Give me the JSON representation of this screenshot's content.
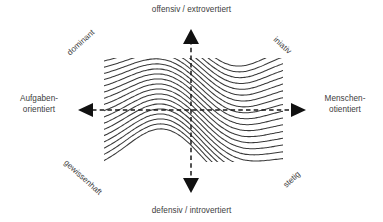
{
  "diagram": {
    "axes": {
      "top": {
        "name": "vertical-axis-top",
        "label": "offensiv / extrovertiert",
        "arrow": "arrow-up"
      },
      "bottom": {
        "name": "vertical-axis-bottom",
        "label": "defensiv / introvertiert",
        "arrow": "arrow-down"
      },
      "left": {
        "name": "horizontal-axis-left",
        "label": "Aufgaben-\norientiert",
        "arrow": "arrow-left"
      },
      "right": {
        "name": "horizontal-axis-right",
        "label": "Menschen-\notientiert",
        "arrow": "arrow-right"
      }
    },
    "quadrants": [
      {
        "key": "dominant",
        "label": "dominant",
        "position": "top-left",
        "rotation": -42
      },
      {
        "key": "iniativ",
        "label": "iniativ",
        "position": "top-right",
        "rotation": 42
      },
      {
        "key": "gewissenhaft",
        "label": "gewissenhaft",
        "position": "bottom-left",
        "rotation": 42
      },
      {
        "key": "stetig",
        "label": "stetig",
        "position": "bottom-right",
        "rotation": -42
      }
    ],
    "colors": {
      "background": "#ffffff",
      "text": "#3d3d3d",
      "curve": "#3a3a3a",
      "axis": "#1a1a1a"
    }
  },
  "chart_data": {
    "type": "line",
    "xlabel": "Aufgabenorientiert ↔ Menschenorientiert",
    "ylabel": "defensiv / introvertiert ↔ offensiv / extrovertiert",
    "grid": false,
    "legend_position": "none",
    "xlim": [
      0,
      100
    ],
    "ylim": [
      0,
      100
    ],
    "annotations": [
      "offensiv / extrovertiert",
      "defensiv / introvertiert",
      "Aufgaben-orientiert",
      "Menschen-otientiert",
      "dominant",
      "iniativ",
      "gewissenhaft",
      "stetig"
    ],
    "series_count": 22,
    "field": {
      "left_edge_x": 104,
      "right_edge_x": 283,
      "top_edge_y": 60,
      "bottom_edge_y": 160,
      "center_x": 191,
      "center_y": 110,
      "curve_count": 22,
      "stroke_width": 1.05
    }
  }
}
